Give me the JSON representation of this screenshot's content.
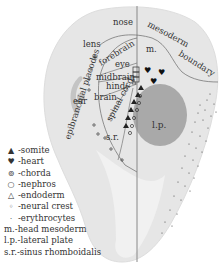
{
  "diagram": {
    "regions": {
      "nose": "nose",
      "mesoderm_boundary_1": "mesoderm",
      "mesoderm_boundary_2": "boundary",
      "lens": "lens",
      "forebrain": "forebrain",
      "eye": "eye",
      "midbrain": "midbrain",
      "hind": "hind-",
      "brain": "brain",
      "ear": "ear",
      "spinal_cord": "spinal cord",
      "sr": "s.r.",
      "m": "m.",
      "lp": "l.p.",
      "epibranchial_placodes": "epibranchial placodes"
    },
    "colors": {
      "embryo_fill": "#e6e6e6",
      "embryo_inner": "#f2f2f2",
      "lateral_plate": "#a9a9a9",
      "placode": "#bdbdbd",
      "line": "#777777",
      "ink": "#222222"
    }
  },
  "legend": {
    "items": [
      {
        "symbol": "▲",
        "label": "-somite"
      },
      {
        "symbol": "♥",
        "label": "-heart"
      },
      {
        "symbol": "⊚",
        "label": "-chorda"
      },
      {
        "symbol": "○",
        "label": "-nephros"
      },
      {
        "symbol": "△",
        "label": "-endoderm"
      },
      {
        "symbol": "◦",
        "label": "-neural crest"
      },
      {
        "symbol": "·",
        "label": "-erythrocytes"
      }
    ],
    "abbreviations": [
      {
        "abbr": "m.",
        "label": "-head mesoderm"
      },
      {
        "abbr": "l.p.",
        "label": "-lateral plate"
      },
      {
        "abbr": "s.r.",
        "label": "-sinus rhomboidalis"
      }
    ]
  }
}
